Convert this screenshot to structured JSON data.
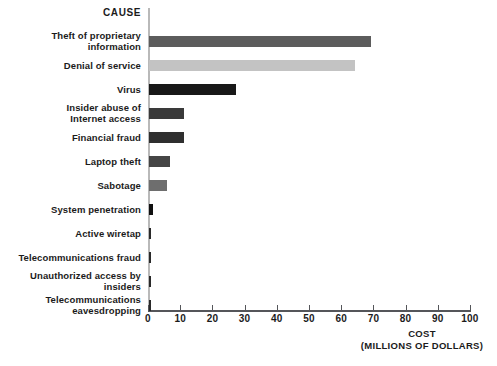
{
  "chart_data": {
    "type": "bar",
    "orientation": "horizontal",
    "title": "",
    "xlabel": "COST",
    "xlabel_sub": "(MILLIONS OF DOLLARS)",
    "ylabel": "CAUSE",
    "xlim": [
      0,
      100
    ],
    "xticks": [
      0,
      10,
      20,
      30,
      40,
      50,
      60,
      70,
      80,
      90,
      100
    ],
    "grid": false,
    "legend": "none",
    "categories": [
      "Theft of proprietary information",
      "Denial of service",
      "Virus",
      "Insider abuse of Internet access",
      "Financial fraud",
      "Laptop theft",
      "Sabotage",
      "System penetration",
      "Active wiretap",
      "Telecommunications fraud",
      "Unauthorized access by insiders",
      "Telecommunications eavesdropping"
    ],
    "values": [
      69,
      64,
      27,
      11,
      11,
      6.5,
      5.5,
      1.3,
      0.5,
      0.4,
      0.4,
      0.3
    ],
    "bar_colors": [
      "#5c5c5c",
      "#c3c3c3",
      "#181818",
      "#3a3a3a",
      "#2f2f2f",
      "#454545",
      "#6e6e6e",
      "#101010",
      "#2a2a2a",
      "#2a2a2a",
      "#2a2a2a",
      "#2a2a2a"
    ]
  },
  "labels": {
    "cause_header": "CAUSE",
    "rows": [
      {
        "line1": "Theft of proprietary",
        "line2": "information"
      },
      {
        "line1": "Denial of service",
        "line2": ""
      },
      {
        "line1": "Virus",
        "line2": ""
      },
      {
        "line1": "Insider abuse of",
        "line2": "Internet access"
      },
      {
        "line1": "Financial fraud",
        "line2": ""
      },
      {
        "line1": "Laptop theft",
        "line2": ""
      },
      {
        "line1": "Sabotage",
        "line2": ""
      },
      {
        "line1": "System penetration",
        "line2": ""
      },
      {
        "line1": "Active wiretap",
        "line2": ""
      },
      {
        "line1": "Telecommunications fraud",
        "line2": ""
      },
      {
        "line1": "Unauthorized access by",
        "line2": "insiders"
      },
      {
        "line1": "Telecommunications",
        "line2": "eavesdropping"
      }
    ],
    "tick_labels": [
      "0",
      "10",
      "20",
      "30",
      "40",
      "50",
      "60",
      "70",
      "80",
      "90",
      "100"
    ],
    "axis_caption_line1": "COST",
    "axis_caption_line2": "(MILLIONS OF DOLLARS)"
  },
  "colors": {
    "background": "#ffffff",
    "text": "#1b1b1b",
    "axis_x": "#55565a",
    "axis_y": "#b9b9b9"
  }
}
